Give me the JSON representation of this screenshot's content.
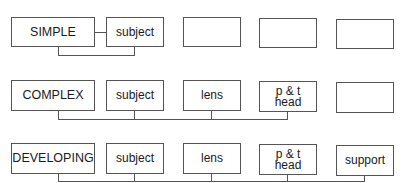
{
  "diagram": {
    "rows": [
      {
        "name": "simple",
        "label": "SIMPLE",
        "slots": [
          "subject",
          "",
          "",
          ""
        ]
      },
      {
        "name": "complex",
        "label": "COMPLEX",
        "slots": [
          "subject",
          "lens",
          "p & t\nhead",
          ""
        ]
      },
      {
        "name": "developing",
        "label": "DEVELOPING",
        "slots": [
          "subject",
          "lens",
          "p & t\nhead",
          "support"
        ]
      }
    ]
  },
  "colors": {
    "line": "#555555",
    "text": "#1a1a1a",
    "background": "#ffffff"
  }
}
